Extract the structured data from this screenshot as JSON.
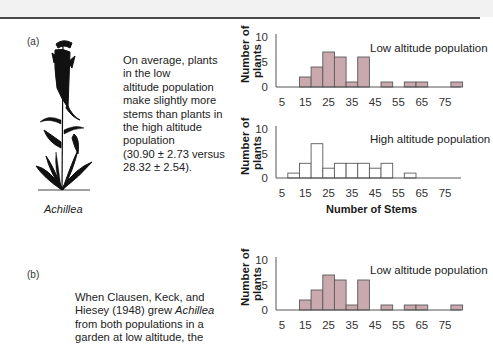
{
  "figure": {
    "panel_a_label": "(a)",
    "panel_b_label": "(b)",
    "species_caption": "Achillea",
    "panel_a_text": "On average, plants in the low altitude population make slightly more stems than plants in the high altitude population (30.90 ± 2.73 versus 28.32 ± 2.54).",
    "panel_a_lines": [
      "On average, plants",
      "in the low",
      "altitude population",
      "make slightly more",
      "stems than plants in",
      "the high altitude",
      "population",
      "(30.90 ± 2.73 versus",
      "28.32 ± 2.54)."
    ],
    "panel_b_lines": [
      "When Clausen, Keck, and",
      "Hiesey (1948) grew ",
      "from both populations in a",
      "garden at low altitude, the"
    ],
    "panel_b_italic": "Achillea",
    "y_axis_label_line1": "Number of",
    "y_axis_label_line2": "plants",
    "x_axis_title": "Number of Stems",
    "colors": {
      "low_fill": "#c9a9ad",
      "high_fill": "#ffffff",
      "bar_stroke": "#5a5a5a",
      "axis": "#555555"
    }
  },
  "chart_data": [
    {
      "type": "bar",
      "title": "Low altitude population",
      "panel": "a",
      "xlabel": "",
      "ylabel": "Number of plants",
      "x_ticks": [
        5,
        15,
        25,
        35,
        45,
        55,
        65,
        75
      ],
      "y_ticks": [
        0,
        5,
        10
      ],
      "ylim": [
        0,
        10
      ],
      "bin_width": 5,
      "categories": [
        15,
        20,
        25,
        30,
        35,
        40,
        45,
        50,
        55,
        60,
        65,
        70,
        75,
        80
      ],
      "values": [
        2,
        4,
        7,
        6,
        1,
        6,
        0,
        1,
        0,
        1,
        1,
        0,
        0,
        1
      ],
      "legend": "Low altitude population",
      "grid": false
    },
    {
      "type": "bar",
      "title": "High altitude population",
      "panel": "a",
      "xlabel": "Number of Stems",
      "ylabel": "Number of plants",
      "x_ticks": [
        5,
        15,
        25,
        35,
        45,
        55,
        65,
        75
      ],
      "y_ticks": [
        0,
        5,
        10
      ],
      "ylim": [
        0,
        10
      ],
      "bin_width": 5,
      "categories": [
        10,
        15,
        20,
        25,
        30,
        35,
        40,
        45,
        50,
        55,
        60
      ],
      "values": [
        1,
        3,
        7,
        2,
        3,
        3,
        3,
        2,
        3,
        0,
        1
      ],
      "legend": "High altitude population",
      "grid": false
    },
    {
      "type": "bar",
      "title": "Low altitude population",
      "panel": "b",
      "xlabel": "",
      "ylabel": "Number of plants",
      "x_ticks": [
        5,
        15,
        25,
        35,
        45,
        55,
        65,
        75
      ],
      "y_ticks": [
        0,
        5,
        10
      ],
      "ylim": [
        0,
        10
      ],
      "bin_width": 5,
      "categories": [
        15,
        20,
        25,
        30,
        35,
        40,
        45,
        50,
        55,
        60,
        65,
        70,
        75,
        80
      ],
      "values": [
        2,
        4,
        7,
        6,
        1,
        6,
        0,
        1,
        0,
        1,
        1,
        0,
        0,
        1
      ],
      "legend": "Low altitude population",
      "grid": false
    }
  ]
}
